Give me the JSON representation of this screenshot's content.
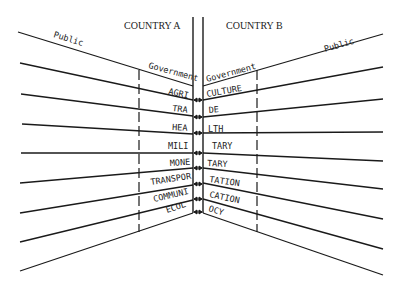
{
  "diagram": {
    "country_a": {
      "title": "COUNTRY A",
      "public_label": "Public",
      "government_label": "Government"
    },
    "country_b": {
      "title": "COUNTRY B",
      "public_label": "Public",
      "government_label": "Government"
    },
    "sectors": [
      {
        "name": "AGRICULTURE",
        "left_part": "AGRI",
        "right_part": "CULTURE"
      },
      {
        "name": "TRADE",
        "left_part": "TRA",
        "right_part": "DE"
      },
      {
        "name": "HEALTH",
        "left_part": "HEA",
        "right_part": "LTH"
      },
      {
        "name": "MILITARY",
        "left_part": "MILI",
        "right_part": "TARY"
      },
      {
        "name": "MONETARY",
        "left_part": "MONE",
        "right_part": "TARY"
      },
      {
        "name": "TRANSPORTATION",
        "left_part": "TRANSPOR",
        "right_part": "TATION"
      },
      {
        "name": "COMMUNICATION",
        "left_part": "COMMUNI",
        "right_part": "CATION"
      },
      {
        "name": "ECOLOGY",
        "left_part": "ECOL",
        "right_part": "OCY"
      }
    ],
    "colors": {
      "line": "#1a1a1a",
      "background": "#ffffff"
    }
  }
}
